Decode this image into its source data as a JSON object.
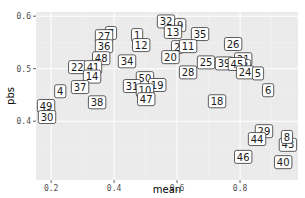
{
  "chart_data": {
    "type": "scatter",
    "title": "",
    "xlabel": "mean",
    "ylabel": "pbs",
    "xlim": [
      0.152,
      0.984
    ],
    "ylim": [
      0.288,
      0.608
    ],
    "x_ticks": [
      0.2,
      0.4,
      0.6,
      0.8
    ],
    "x_tick_labels": [
      "0.2",
      "0.4",
      "0.6",
      "0.8"
    ],
    "y_ticks": [
      0.4,
      0.5,
      0.6
    ],
    "y_tick_labels": [
      "0.4",
      "0.5",
      "0.6"
    ],
    "grid": true,
    "legend": "none",
    "point_style": "text-label",
    "points": [
      {
        "label": "32",
        "x": 0.565,
        "y": 0.59
      },
      {
        "label": "9",
        "x": 0.61,
        "y": 0.583
      },
      {
        "label": "13",
        "x": 0.587,
        "y": 0.57
      },
      {
        "label": "35",
        "x": 0.673,
        "y": 0.566
      },
      {
        "label": "7",
        "x": 0.39,
        "y": 0.568
      },
      {
        "label": "27",
        "x": 0.368,
        "y": 0.562
      },
      {
        "label": "1",
        "x": 0.473,
        "y": 0.564
      },
      {
        "label": "36",
        "x": 0.368,
        "y": 0.543
      },
      {
        "label": "12",
        "x": 0.486,
        "y": 0.545
      },
      {
        "label": "2",
        "x": 0.6,
        "y": 0.541
      },
      {
        "label": "11",
        "x": 0.635,
        "y": 0.543
      },
      {
        "label": "26",
        "x": 0.778,
        "y": 0.547
      },
      {
        "label": "20",
        "x": 0.579,
        "y": 0.522
      },
      {
        "label": "48",
        "x": 0.359,
        "y": 0.52
      },
      {
        "label": "34",
        "x": 0.441,
        "y": 0.514
      },
      {
        "label": "22",
        "x": 0.283,
        "y": 0.503
      },
      {
        "label": "41",
        "x": 0.333,
        "y": 0.503
      },
      {
        "label": "25",
        "x": 0.692,
        "y": 0.512
      },
      {
        "label": "21",
        "x": 0.81,
        "y": 0.518
      },
      {
        "label": "39",
        "x": 0.749,
        "y": 0.51
      },
      {
        "label": "3",
        "x": 0.816,
        "y": 0.505
      },
      {
        "label": "45",
        "x": 0.79,
        "y": 0.509
      },
      {
        "label": "24",
        "x": 0.816,
        "y": 0.493
      },
      {
        "label": "5",
        "x": 0.857,
        "y": 0.491
      },
      {
        "label": "14",
        "x": 0.33,
        "y": 0.485
      },
      {
        "label": "28",
        "x": 0.635,
        "y": 0.493
      },
      {
        "label": "50",
        "x": 0.498,
        "y": 0.482
      },
      {
        "label": "31",
        "x": 0.457,
        "y": 0.467
      },
      {
        "label": "19",
        "x": 0.537,
        "y": 0.469
      },
      {
        "label": "10",
        "x": 0.498,
        "y": 0.459
      },
      {
        "label": "47",
        "x": 0.502,
        "y": 0.442
      },
      {
        "label": "37",
        "x": 0.292,
        "y": 0.465
      },
      {
        "label": "4",
        "x": 0.229,
        "y": 0.457
      },
      {
        "label": "6",
        "x": 0.889,
        "y": 0.459
      },
      {
        "label": "18",
        "x": 0.727,
        "y": 0.438
      },
      {
        "label": "38",
        "x": 0.346,
        "y": 0.436
      },
      {
        "label": "49",
        "x": 0.184,
        "y": 0.429
      },
      {
        "label": "30",
        "x": 0.187,
        "y": 0.408
      },
      {
        "label": "29",
        "x": 0.876,
        "y": 0.381
      },
      {
        "label": "44",
        "x": 0.854,
        "y": 0.366
      },
      {
        "label": "43",
        "x": 0.952,
        "y": 0.355
      },
      {
        "label": "8",
        "x": 0.949,
        "y": 0.37
      },
      {
        "label": "46",
        "x": 0.81,
        "y": 0.332
      },
      {
        "label": "40",
        "x": 0.937,
        "y": 0.322
      }
    ]
  },
  "colors": {
    "panel_background": "#ebebeb",
    "grid_major": "#ffffff",
    "grid_minor": "#f5f5f5",
    "label_fill": "#ffffff",
    "label_border": "#333333",
    "tick_text": "#4d4d4d"
  }
}
